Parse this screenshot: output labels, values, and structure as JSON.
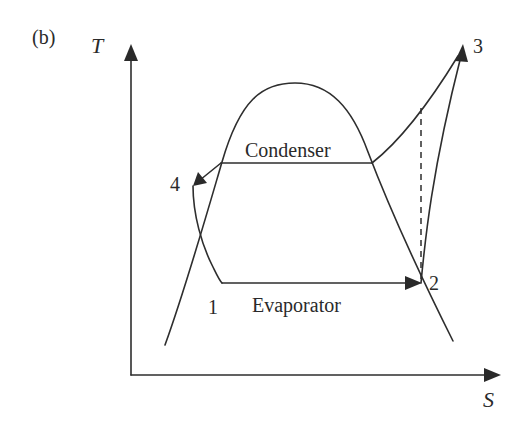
{
  "figure": {
    "panel_label": "(b)",
    "axes": {
      "y_label": "T",
      "x_label": "S"
    },
    "process_labels": {
      "condenser": "Condenser",
      "evaporator": "Evaporator"
    },
    "state_points": [
      {
        "id": "1",
        "label": "1"
      },
      {
        "id": "2",
        "label": "2"
      },
      {
        "id": "3",
        "label": "3"
      },
      {
        "id": "4",
        "label": "4"
      }
    ],
    "colors": {
      "line": "#2e2e2e",
      "text": "#2a2a2a",
      "background": "#ffffff"
    }
  }
}
